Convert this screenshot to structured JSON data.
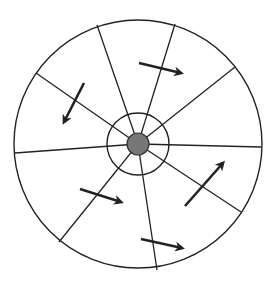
{
  "diagram": {
    "type": "radial-sector-wheel",
    "colors": {
      "stroke": "#222222",
      "center_fill": "#777777",
      "background": "#ffffff"
    },
    "center": {
      "x": 138,
      "y": 144
    },
    "outer_radius": 124,
    "inner_ring_radius": 31,
    "core_radius": 11,
    "spoke_endpoints": [
      {
        "x": 97,
        "y": 25
      },
      {
        "x": 175,
        "y": 24
      },
      {
        "x": 235,
        "y": 67
      },
      {
        "x": 261,
        "y": 147
      },
      {
        "x": 241,
        "y": 212
      },
      {
        "x": 157,
        "y": 270
      },
      {
        "x": 59,
        "y": 242
      },
      {
        "x": 15,
        "y": 153
      },
      {
        "x": 36,
        "y": 73
      }
    ],
    "arrows": [
      {
        "x1": 84,
        "y1": 83,
        "x2": 64,
        "y2": 122
      },
      {
        "x1": 139,
        "y1": 63,
        "x2": 181,
        "y2": 73
      },
      {
        "x1": 185,
        "y1": 206,
        "x2": 223,
        "y2": 163
      },
      {
        "x1": 80,
        "y1": 189,
        "x2": 121,
        "y2": 202
      },
      {
        "x1": 141,
        "y1": 239,
        "x2": 182,
        "y2": 248
      }
    ]
  }
}
